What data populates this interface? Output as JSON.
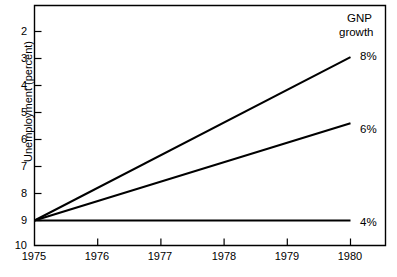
{
  "chart_data": {
    "type": "line",
    "title": "",
    "xlabel": "",
    "ylabel": "Unemployment (percent)",
    "x": [
      1975,
      1980
    ],
    "xlim": [
      1975,
      1980
    ],
    "ylim": [
      10,
      2
    ],
    "y_inverted": true,
    "grid": false,
    "legend_position": "right-of-line-ends",
    "legend_title": "GNP",
    "legend_title_line2": "growth",
    "xticks": [
      "1975",
      "1976",
      "1977",
      "1978",
      "1979",
      "1980"
    ],
    "xtick_values": [
      1975,
      1976,
      1977,
      1978,
      1979,
      1980
    ],
    "yticks": [
      "2",
      "3",
      "4",
      "5",
      "6",
      "7",
      "8",
      "9",
      "10"
    ],
    "ytick_values": [
      2,
      3,
      4,
      5,
      6,
      7,
      8,
      9,
      10
    ],
    "series": [
      {
        "name": "8%",
        "values": [
          9.0,
          2.95
        ]
      },
      {
        "name": "6%",
        "values": [
          9.0,
          5.4
        ]
      },
      {
        "name": "4%",
        "values": [
          9.0,
          9.0
        ]
      }
    ],
    "line_color": "#000000",
    "axis_color": "#000000"
  },
  "axes": {
    "ylabel": "Unemployment (percent)",
    "ytick_labels": [
      "2",
      "3",
      "4",
      "5",
      "6",
      "7",
      "8",
      "9",
      "10"
    ],
    "xtick_labels": [
      "1975",
      "1976",
      "1977",
      "1978",
      "1979",
      "1980"
    ]
  },
  "legend": {
    "title_line1": "GNP",
    "title_line2": "growth",
    "entries": [
      "8%",
      "6%",
      "4%"
    ]
  }
}
